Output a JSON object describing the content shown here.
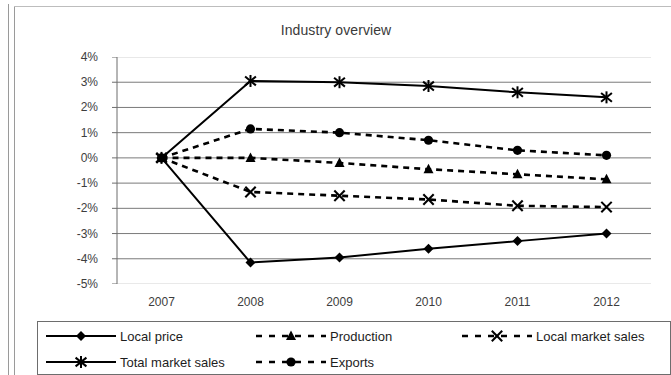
{
  "chart_data": {
    "type": "line",
    "title": "Industry overview",
    "xlabel": "",
    "ylabel": "",
    "categories": [
      "2007",
      "2008",
      "2009",
      "2010",
      "2011",
      "2012"
    ],
    "x": [
      2007,
      2008,
      2009,
      2010,
      2011,
      2012
    ],
    "ylim": [
      -5,
      4
    ],
    "ytick_labels": [
      "4%",
      "3%",
      "2%",
      "1%",
      "0%",
      "-1%",
      "-2%",
      "-3%",
      "-4%",
      "-5%"
    ],
    "ytick_values": [
      4,
      3,
      2,
      1,
      0,
      -1,
      -2,
      -3,
      -4,
      -5
    ],
    "yunit": "%",
    "grid": true,
    "legend_position": "bottom",
    "series": [
      {
        "name": "Local price",
        "values": [
          0.0,
          -4.15,
          -3.95,
          -3.6,
          -3.3,
          -3.0
        ],
        "marker": "diamond",
        "line_style": "solid",
        "color": "#000000"
      },
      {
        "name": "Total market sales",
        "values": [
          0.0,
          3.05,
          3.0,
          2.85,
          2.6,
          2.4
        ],
        "marker": "asterisk",
        "line_style": "solid",
        "color": "#000000"
      },
      {
        "name": "Production",
        "values": [
          0.0,
          0.0,
          -0.2,
          -0.45,
          -0.65,
          -0.85
        ],
        "marker": "triangle",
        "line_style": "dashed",
        "color": "#000000"
      },
      {
        "name": "Exports",
        "values": [
          0.0,
          1.15,
          1.0,
          0.7,
          0.3,
          0.1
        ],
        "marker": "circle",
        "line_style": "dashed",
        "color": "#000000"
      },
      {
        "name": "Local market sales",
        "values": [
          0.0,
          -1.35,
          -1.5,
          -1.65,
          -1.9,
          -1.95
        ],
        "marker": "cross",
        "line_style": "dashed",
        "color": "#000000"
      }
    ]
  },
  "legend": {
    "entries": [
      {
        "label": "Local price",
        "series_index": 0
      },
      {
        "label": "Production",
        "series_index": 2
      },
      {
        "label": "Local market sales",
        "series_index": 4
      },
      {
        "label": "Total market sales",
        "series_index": 1
      },
      {
        "label": "Exports",
        "series_index": 3
      }
    ]
  },
  "colors": {
    "ink": "#000000",
    "grid": "#7a7a7a",
    "axis": "#6d6d6d",
    "text": "#3d3d3d",
    "title": "#3a3a3a",
    "background": "#ffffff"
  }
}
